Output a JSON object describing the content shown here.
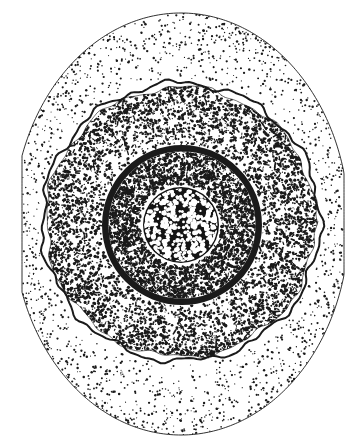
{
  "figure": {
    "title": "Stippled cross-section of a spherical cell",
    "style": "pen-and-ink stipple drawing",
    "background_color": "#ffffff",
    "ink_color": "#1a1a1a",
    "canvas": {
      "width": 358,
      "height": 448
    },
    "zones": [
      {
        "id": "outer-halo",
        "name": "outer-zone",
        "label": "Outer stippled halo",
        "shape": "ellipse clipped at left and right edges",
        "center": {
          "cx": 181,
          "cy": 224
        },
        "radii": {
          "rx": 168,
          "ry": 211
        },
        "clip": {
          "left": 22,
          "right": 344
        },
        "fill": "#ffffff",
        "outline": "thin",
        "outline_width": 0.9,
        "stipple": {
          "density": "sparse",
          "dot_count": 1500,
          "dot_radius_min": 0.5,
          "dot_radius_max": 1.25,
          "gradient": "dense at rim, fading toward center"
        }
      },
      {
        "id": "middle-cortex",
        "name": "middle-zone",
        "label": "Middle dense stippled cortex",
        "shape": "irregular wavy circle",
        "center": {
          "cx": 181,
          "cy": 222
        },
        "radius": 139,
        "fill": "#ffffff",
        "outline": "wavy double contour",
        "outline_width": 2.0,
        "stipple": {
          "density": "dense",
          "dot_count": 5200,
          "dot_radius_min": 0.6,
          "dot_radius_max": 1.7,
          "gradient": "dense at rim, thinning toward inner ring"
        }
      },
      {
        "id": "inner-ring",
        "name": "inner-zone",
        "label": "Inner granular zone with heavy dark ring",
        "shape": "circle",
        "center": {
          "cx": 182,
          "cy": 225
        },
        "radius": 80,
        "fill": "#ffffff",
        "outline": "thick solid ring",
        "outline_width": 6.5,
        "stipple": {
          "density": "very dense",
          "dot_count": 3400,
          "dot_radius_min": 0.6,
          "dot_radius_max": 1.8,
          "gradient": "uniformly dense"
        }
      },
      {
        "id": "nucleus-core",
        "name": "core-zone",
        "label": "Dark central nucleus with light speckles",
        "shape": "circle",
        "center": {
          "cx": 181,
          "cy": 225
        },
        "radius": 38,
        "fill": "#141414",
        "outline": "none",
        "outline_width": 0,
        "stipple": {
          "density": "inverse",
          "dot_count": 420,
          "dot_radius_min": 1.0,
          "dot_radius_max": 2.6,
          "dot_color": "#ffffff",
          "gradient": "white speckles on black field"
        }
      }
    ]
  }
}
